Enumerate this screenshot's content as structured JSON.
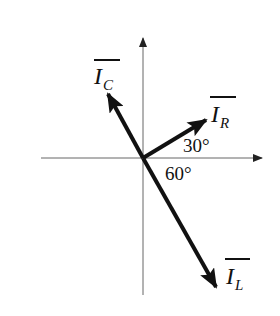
{
  "diagram": {
    "type": "phasor-diagram",
    "colors": {
      "axis": "#555555",
      "vector": "#111111",
      "text": "#111111",
      "background": "#ffffff"
    },
    "axes": {
      "origin": [
        143,
        158
      ],
      "horizontal": {
        "from": [
          41,
          158
        ],
        "to": [
          262,
          158
        ]
      },
      "vertical": {
        "from": [
          143,
          295
        ],
        "to": [
          143,
          38
        ]
      }
    },
    "vectors": [
      {
        "id": "I_C",
        "label_main": "I",
        "label_sub": "C",
        "tip": [
          108,
          94
        ],
        "angle_deg": 120
      },
      {
        "id": "I_R",
        "label_main": "I",
        "label_sub": "R",
        "tip": [
          206,
          120
        ],
        "angle_deg": 30
      },
      {
        "id": "I_L",
        "label_main": "I",
        "label_sub": "L",
        "tip": [
          216,
          287
        ],
        "angle_deg": -60
      }
    ],
    "angle_labels": [
      {
        "id": "angle-30",
        "text": "30°"
      },
      {
        "id": "angle-60",
        "text": "60°"
      }
    ]
  }
}
